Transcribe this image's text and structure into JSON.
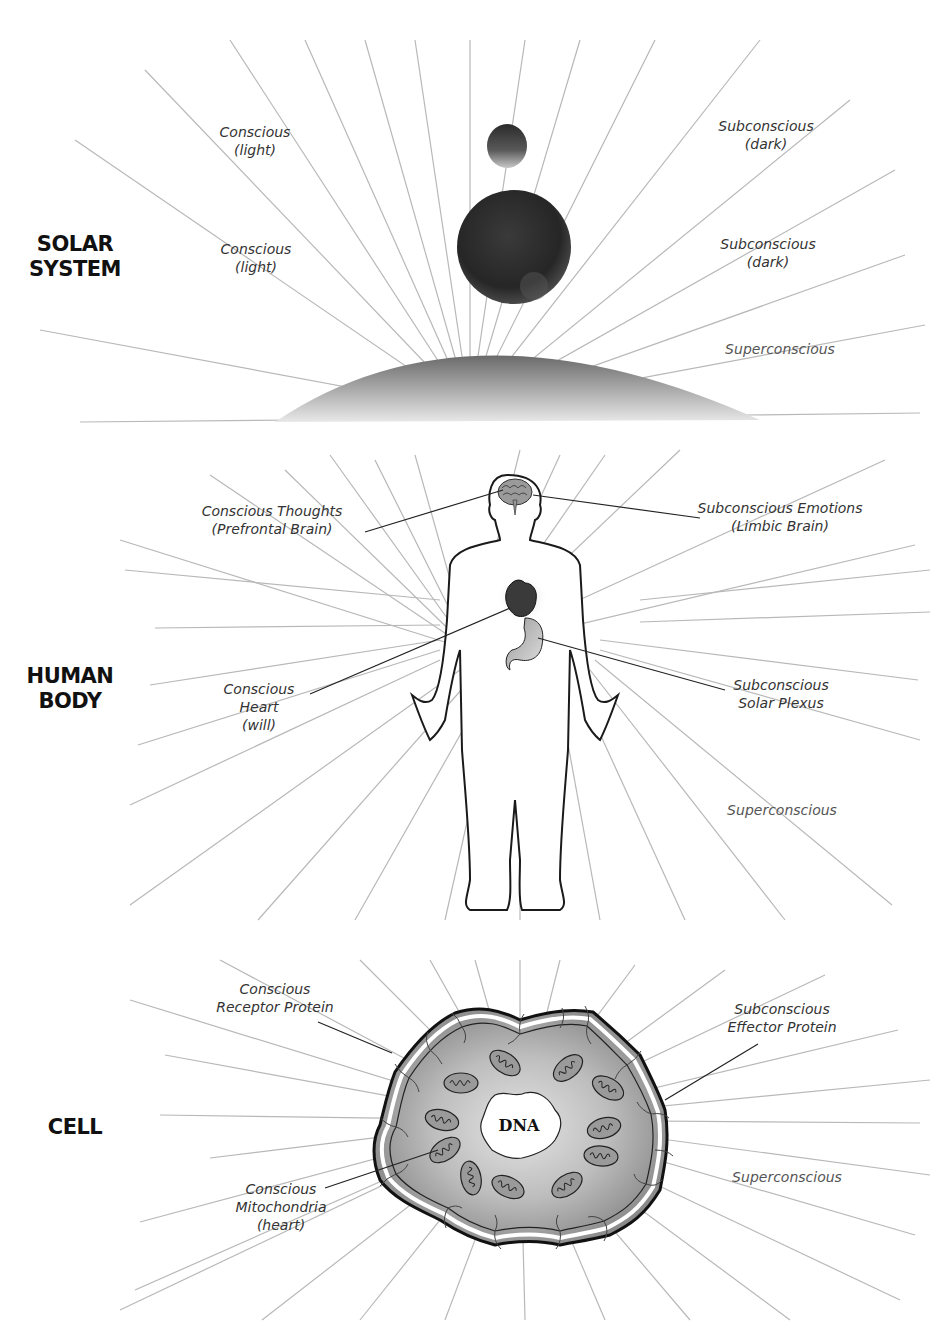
{
  "sections": [
    {
      "id": "solar-system",
      "title": [
        "SOLAR",
        "SYSTEM"
      ],
      "labels": [
        {
          "lines": [
            "Conscious",
            "(light)"
          ],
          "x": 255,
          "y": 123
        },
        {
          "lines": [
            "Conscious",
            "(light)"
          ],
          "x": 256,
          "y": 240
        },
        {
          "lines": [
            "Subconscious",
            "(dark)"
          ],
          "x": 766,
          "y": 117
        },
        {
          "lines": [
            "Subconscious",
            "(dark)"
          ],
          "x": 768,
          "y": 235
        },
        {
          "lines": [
            "Superconscious"
          ],
          "x": 780,
          "y": 340,
          "style": "super"
        }
      ]
    },
    {
      "id": "human-body",
      "title": [
        "HUMAN",
        "BODY"
      ],
      "labels": [
        {
          "lines": [
            "Conscious Thoughts",
            "(Prefrontal Brain)"
          ],
          "x": 272,
          "y": 502
        },
        {
          "lines": [
            "Subconscious Emotions",
            "(Limbic Brain)"
          ],
          "x": 780,
          "y": 499
        },
        {
          "lines": [
            "Conscious",
            "Heart",
            "(will)"
          ],
          "x": 259,
          "y": 680
        },
        {
          "lines": [
            "Subconscious",
            "Solar Plexus"
          ],
          "x": 781,
          "y": 676
        },
        {
          "lines": [
            "Superconscious"
          ],
          "x": 782,
          "y": 801,
          "style": "super"
        }
      ]
    },
    {
      "id": "cell",
      "title": [
        "CELL"
      ],
      "labels": [
        {
          "lines": [
            "Conscious",
            "Receptor Protein"
          ],
          "x": 275,
          "y": 980
        },
        {
          "lines": [
            "Subconscious",
            "Effector Protein"
          ],
          "x": 782,
          "y": 1000
        },
        {
          "lines": [
            "Conscious",
            "Mitochondria",
            "(heart)"
          ],
          "x": 281,
          "y": 1180
        },
        {
          "lines": [
            "Superconscious"
          ],
          "x": 787,
          "y": 1168,
          "style": "super"
        }
      ],
      "nucleus_label": "DNA"
    }
  ],
  "colors": {
    "ray": "#b8b8b8",
    "outline": "#1a1a1a",
    "label_text": "#333333",
    "super_text": "#555555",
    "cell_fill_dark": "#8c8c8c",
    "cell_fill_light": "#dcdcdc"
  }
}
